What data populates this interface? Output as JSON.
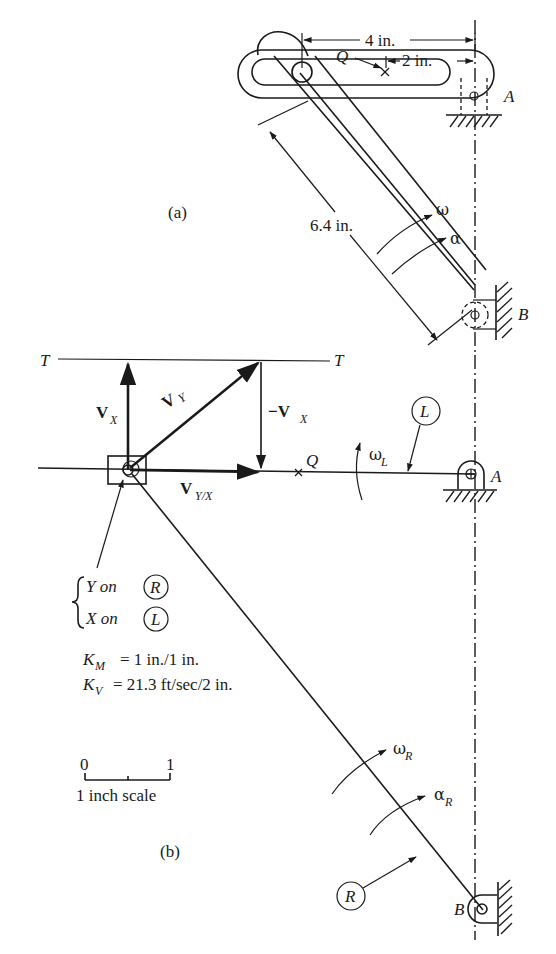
{
  "figure": {
    "part_a": {
      "label": "(a)",
      "dim_4in": "4 in.",
      "dim_2in": "2 in.",
      "dim_6_4in": "6.4 in.",
      "point_q": "Q",
      "pivot_a": "A",
      "pivot_b": "B",
      "omega": "ω",
      "alpha": "α"
    },
    "part_b": {
      "label": "(b)",
      "line_t_left": "T",
      "line_t_right": "T",
      "vx": {
        "main": "V",
        "sub": "X"
      },
      "vy": {
        "main": "V",
        "sub": "Y"
      },
      "neg_vx": {
        "main": "−V",
        "sub": "X"
      },
      "vyx": {
        "main": "V",
        "sub": "Y/X"
      },
      "point_q": "Q",
      "omega_l": {
        "main": "ω",
        "sub": "L"
      },
      "link_l": "L",
      "pivot_a": "A",
      "pivot_b": "B",
      "link_r": "R",
      "omega_r": {
        "main": "ω",
        "sub": "R"
      },
      "alpha_r": {
        "main": "α",
        "sub": "R"
      },
      "legend": {
        "y_on": "Y on",
        "y_link": "R",
        "x_on": "X on",
        "x_link": "L"
      },
      "scales": {
        "km_main": "K",
        "km_sub": "M",
        "km_value": "= 1 in./1 in.",
        "kv_main": "K",
        "kv_sub": "V",
        "kv_value": "= 21.3 ft/sec/2 in."
      },
      "scale_bar": {
        "start": "0",
        "end": "1",
        "caption": "1 inch scale"
      }
    }
  }
}
